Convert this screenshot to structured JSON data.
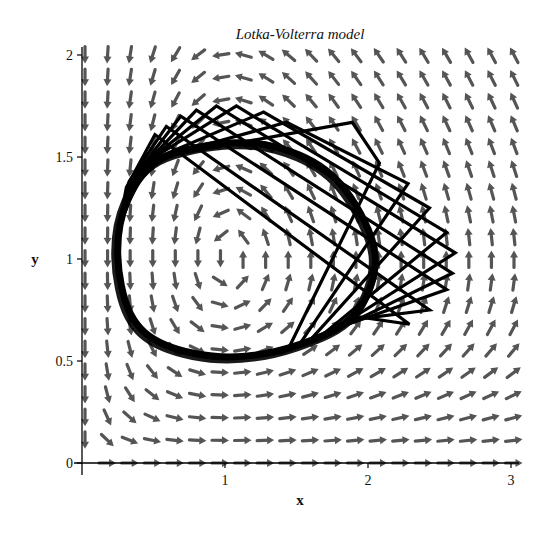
{
  "chart_data": {
    "type": "vector-field-phase-portrait",
    "title": "Lotka-Volterra model",
    "xlabel": "x",
    "ylabel": "y",
    "xlim": [
      0,
      3
    ],
    "ylim": [
      0,
      2
    ],
    "xticks": [
      {
        "value": 1,
        "label": "1"
      },
      {
        "value": 2,
        "label": "2"
      },
      {
        "value": 3,
        "label": "3"
      }
    ],
    "yticks": [
      {
        "value": 0,
        "label": "0"
      },
      {
        "value": 0.5,
        "label": "0.5"
      },
      {
        "value": 1,
        "label": "1"
      },
      {
        "value": 1.5,
        "label": "1.5"
      },
      {
        "value": 2,
        "label": "2"
      }
    ],
    "model": {
      "dx_dt": "x*(1-y)",
      "dy_dt": "y*(x-1)",
      "equilibrium": [
        1,
        1
      ]
    },
    "field_grid": {
      "nx": 20,
      "ny": 19
    },
    "orbit_smooth": [
      [
        1.07,
        1.57
      ],
      [
        1.52,
        1.51
      ],
      [
        1.84,
        1.34
      ],
      [
        2.05,
        1.02
      ],
      [
        1.91,
        0.73
      ],
      [
        1.52,
        0.58
      ],
      [
        1.03,
        0.52
      ],
      [
        0.58,
        0.58
      ],
      [
        0.34,
        0.73
      ],
      [
        0.25,
        1.02
      ],
      [
        0.32,
        1.29
      ],
      [
        0.55,
        1.49
      ]
    ],
    "orbit_polygons": [
      [
        [
          1.45,
          0.57
        ],
        [
          2.08,
          1.47
        ],
        [
          1.89,
          1.67
        ],
        [
          0.55,
          1.5
        ],
        [
          0.3,
          1.3
        ]
      ],
      [
        [
          1.52,
          0.58
        ],
        [
          2.28,
          1.37
        ],
        [
          1.43,
          1.67
        ],
        [
          0.5,
          1.49
        ],
        [
          0.3,
          1.28
        ]
      ],
      [
        [
          1.58,
          0.59
        ],
        [
          2.43,
          1.25
        ],
        [
          1.27,
          1.72
        ],
        [
          0.47,
          1.48
        ],
        [
          0.29,
          1.27
        ]
      ],
      [
        [
          1.65,
          0.61
        ],
        [
          2.55,
          1.13
        ],
        [
          1.08,
          1.75
        ],
        [
          0.44,
          1.47
        ],
        [
          0.29,
          1.25
        ]
      ],
      [
        [
          1.71,
          0.63
        ],
        [
          2.61,
          1.03
        ],
        [
          0.94,
          1.75
        ],
        [
          0.41,
          1.45
        ],
        [
          0.28,
          1.24
        ]
      ],
      [
        [
          1.77,
          0.65
        ],
        [
          2.59,
          0.93
        ],
        [
          0.8,
          1.73
        ],
        [
          0.38,
          1.42
        ],
        [
          0.28,
          1.22
        ]
      ],
      [
        [
          1.82,
          0.67
        ],
        [
          2.55,
          0.85
        ],
        [
          0.69,
          1.7
        ],
        [
          0.36,
          1.4
        ],
        [
          0.27,
          1.2
        ]
      ],
      [
        [
          1.87,
          0.7
        ],
        [
          2.43,
          0.75
        ],
        [
          0.59,
          1.65
        ],
        [
          0.33,
          1.38
        ],
        [
          0.27,
          1.18
        ]
      ],
      [
        [
          1.9,
          0.72
        ],
        [
          2.29,
          0.68
        ],
        [
          0.51,
          1.61
        ],
        [
          0.31,
          1.35
        ],
        [
          0.26,
          1.16
        ]
      ]
    ],
    "colors": {
      "field_arrows": "#555555",
      "orbit": "#000000",
      "axes": "#000000"
    },
    "legend": null,
    "grid": false
  }
}
